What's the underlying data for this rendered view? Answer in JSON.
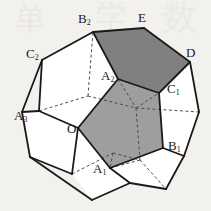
{
  "figure": {
    "background_color": "#f2f1ee",
    "stroke_color": "#1a1a1a",
    "face_fill_light": "#ffffff",
    "face_fill_mid": "#9e9e9e",
    "face_fill_dark": "#808080",
    "dashed_color": "#4d4d4d"
  },
  "labels": [
    {
      "id": "B2",
      "base": "B",
      "sub": "2",
      "x": 78,
      "y": 12
    },
    {
      "id": "E",
      "base": "E",
      "sub": "",
      "x": 138,
      "y": 11
    },
    {
      "id": "D",
      "base": "D",
      "sub": "",
      "x": 186,
      "y": 46
    },
    {
      "id": "C2",
      "base": "C",
      "sub": "2",
      "x": 26,
      "y": 47
    },
    {
      "id": "A2",
      "base": "A",
      "sub": "2",
      "x": 101,
      "y": 69
    },
    {
      "id": "C1",
      "base": "C",
      "sub": "1",
      "x": 167,
      "y": 82
    },
    {
      "id": "A3",
      "base": "A",
      "sub": "3",
      "x": 14,
      "y": 109
    },
    {
      "id": "O",
      "base": "O",
      "sub": "",
      "x": 67,
      "y": 122
    },
    {
      "id": "B1",
      "base": "B",
      "sub": "1",
      "x": 168,
      "y": 139
    },
    {
      "id": "A1",
      "base": "A",
      "sub": "1",
      "x": 93,
      "y": 162
    }
  ],
  "faces": [
    {
      "name": "center-pentagon",
      "shade": "mid",
      "points": "78,128 118,79 159,93 163,148 110,168"
    },
    {
      "name": "upper-right-pentagon",
      "shade": "dark",
      "points": "93,32 118,79 159,93 190,62 144,28"
    },
    {
      "name": "upper-left-pentagon",
      "shade": "light",
      "points": "42,60 93,32 118,79 78,128 39,111"
    },
    {
      "name": "left-pentagon",
      "shade": "light",
      "points": "22,112 39,111 78,128 72,174 30,157"
    },
    {
      "name": "bottom-pentagon",
      "shade": "light",
      "points": "72,174 78,128 110,168 130,183 92,200"
    },
    {
      "name": "lower-right-pentagon",
      "shade": "light",
      "points": "110,168 163,148 184,156 166,189 130,183"
    },
    {
      "name": "right-pentagon",
      "shade": "light",
      "points": "159,93 190,62 199,112 184,156 163,148"
    }
  ],
  "solid_edges": [
    "42,60 93,32",
    "93,32 144,28",
    "144,28 190,62",
    "190,62 199,112",
    "199,112 184,156",
    "184,156 166,189",
    "166,189 130,183",
    "130,183 92,200",
    "92,200 30,157",
    "30,157 22,112",
    "22,112 42,60",
    "22,112 39,111",
    "39,111 78,128",
    "78,128 118,79",
    "118,79 93,32",
    "118,79 159,93",
    "159,93 190,62",
    "159,93 163,148",
    "163,148 184,156",
    "163,148 110,168",
    "110,168 78,128",
    "110,168 130,183",
    "78,128 72,174",
    "72,174 30,157",
    "42,60 39,111"
  ],
  "dashed_edges": [
    "39,111 88,96",
    "88,96 93,32",
    "88,96 136,108",
    "136,108 159,93",
    "136,108 140,160",
    "140,160 110,168",
    "136,108 199,112",
    "118,79 136,108",
    "72,174 113,153",
    "113,153 140,160",
    "113,153 110,168",
    "140,160 166,189"
  ],
  "watermarks": [
    {
      "text": "单",
      "x": 15,
      "y": 4,
      "size": 30,
      "opacity": 0.5
    },
    {
      "text": "学",
      "x": 95,
      "y": 2,
      "size": 32,
      "opacity": 0.45
    },
    {
      "text": "数",
      "x": 162,
      "y": 2,
      "size": 34,
      "opacity": 0.45
    }
  ]
}
